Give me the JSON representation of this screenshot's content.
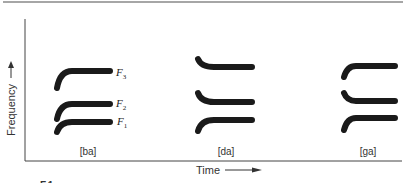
{
  "figure": {
    "y_axis_label": "Frequency",
    "x_axis_label": "Time",
    "y_arrow_icon": "arrow-up-icon",
    "x_arrow_icon": "arrow-right-icon",
    "caption_fragment": "F.1",
    "colors": {
      "ink": "#1a1a1a",
      "axis": "#444444",
      "border": "#888888"
    }
  },
  "syllables": [
    {
      "label": "[ba]",
      "formants": [
        {
          "name": "F",
          "sub": "3",
          "transition": "rising"
        },
        {
          "name": "F",
          "sub": "2",
          "transition": "rising"
        },
        {
          "name": "F",
          "sub": "1",
          "transition": "rising"
        }
      ]
    },
    {
      "label": "[da]",
      "formants": [
        {
          "name": "F",
          "sub": "3",
          "transition": "falling"
        },
        {
          "name": "F",
          "sub": "2",
          "transition": "falling"
        },
        {
          "name": "F",
          "sub": "1",
          "transition": "rising"
        }
      ]
    },
    {
      "label": "[ga]",
      "formants": [
        {
          "name": "F",
          "sub": "3",
          "transition": "rising"
        },
        {
          "name": "F",
          "sub": "2",
          "transition": "falling"
        },
        {
          "name": "F",
          "sub": "1",
          "transition": "rising"
        }
      ]
    }
  ]
}
